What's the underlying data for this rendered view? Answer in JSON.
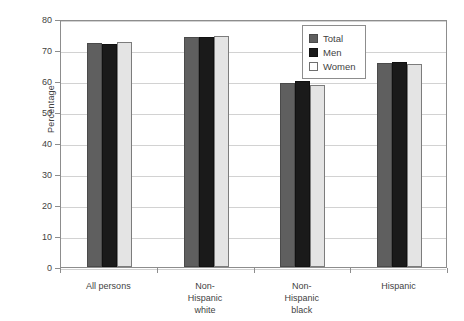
{
  "chart_data": {
    "type": "bar",
    "title": "",
    "xlabel": "",
    "ylabel": "Percentage",
    "ylim": [
      0,
      80
    ],
    "yticks": [
      0,
      10,
      20,
      30,
      40,
      50,
      60,
      70,
      80
    ],
    "grid": true,
    "legend_position": "top-right",
    "categories": [
      "All persons",
      "Non-Hispanic white",
      "Non-Hispanic black",
      "Hispanic"
    ],
    "category_lines": [
      [
        "All persons"
      ],
      [
        "Non-",
        "Hispanic",
        "white"
      ],
      [
        "Non-",
        "Hispanic",
        "black"
      ],
      [
        "Hispanic"
      ]
    ],
    "series": [
      {
        "name": "Total",
        "color": "#5f5f5f",
        "values": [
          72.2,
          74.2,
          59.4,
          65.8
        ]
      },
      {
        "name": "Men",
        "color": "#1a1a1a",
        "values": [
          72.0,
          74.3,
          60.1,
          66.1
        ]
      },
      {
        "name": "Women",
        "color": "#e4e4e4",
        "values": [
          72.5,
          74.5,
          58.6,
          65.4
        ]
      }
    ]
  },
  "legend": {
    "items": [
      {
        "label": "Total"
      },
      {
        "label": "Men"
      },
      {
        "label": "Women"
      }
    ]
  },
  "axis": {
    "y_title": "Percentage",
    "y_tick_labels": [
      "80",
      "70",
      "60",
      "50",
      "40",
      "30",
      "20",
      "10",
      "0"
    ]
  }
}
